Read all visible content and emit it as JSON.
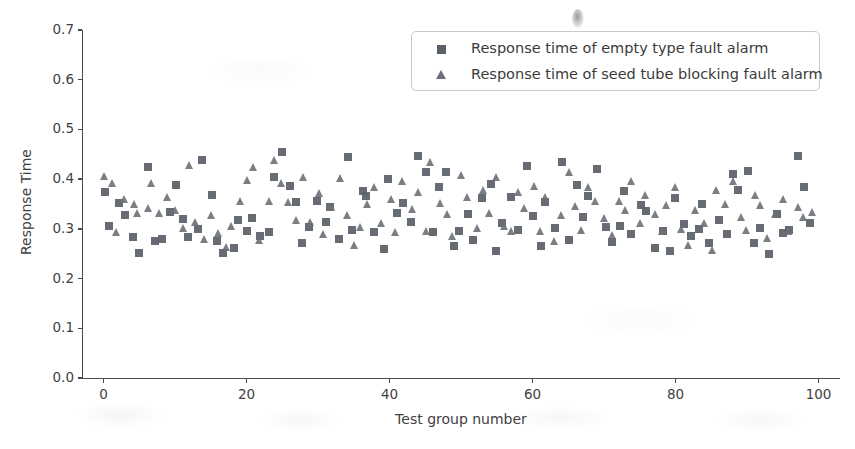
{
  "chart_data": {
    "type": "scatter",
    "title": "",
    "xlabel": "Test group number",
    "ylabel": "Response Time",
    "xlim": [
      -3,
      103
    ],
    "ylim": [
      0.0,
      0.7
    ],
    "xticks": [
      0,
      20,
      40,
      60,
      80,
      100
    ],
    "yticks": [
      "0.0",
      "0.1",
      "0.2",
      "0.3",
      "0.4",
      "0.5",
      "0.6",
      "0.7"
    ],
    "grid": false,
    "legend_position": "upper right",
    "marker_colors": {
      "empty_type": "#5a5f68",
      "seed_tube_blocking": "#6b7078"
    },
    "series": [
      {
        "name": "Response time of empty type fault alarm",
        "marker": "square",
        "color": "#5a5f68",
        "x": [
          0,
          1,
          2,
          3,
          4,
          5,
          6,
          7,
          8,
          9,
          10,
          11,
          12,
          13,
          14,
          15,
          16,
          17,
          18,
          19,
          20,
          21,
          22,
          23,
          24,
          25,
          26,
          27,
          28,
          29,
          30,
          31,
          32,
          33,
          34,
          35,
          36,
          37,
          38,
          39,
          40,
          41,
          42,
          43,
          44,
          45,
          46,
          47,
          48,
          49,
          50,
          51,
          52,
          53,
          54,
          55,
          56,
          57,
          58,
          59,
          60,
          61,
          62,
          63,
          64,
          65,
          66,
          67,
          68,
          69,
          70,
          71,
          72,
          73,
          74,
          75,
          76,
          77,
          78,
          79,
          80,
          81,
          82,
          83,
          84,
          85,
          86,
          87,
          88,
          89,
          90,
          91,
          92,
          93,
          94,
          95,
          96,
          97,
          98,
          99
        ],
        "y": [
          0.37,
          0.31,
          0.35,
          0.33,
          0.29,
          0.25,
          0.42,
          0.28,
          0.28,
          0.34,
          0.39,
          0.32,
          0.29,
          0.3,
          0.44,
          0.37,
          0.27,
          0.25,
          0.26,
          0.32,
          0.29,
          0.32,
          0.28,
          0.3,
          0.41,
          0.45,
          0.39,
          0.35,
          0.27,
          0.3,
          0.36,
          0.31,
          0.34,
          0.28,
          0.45,
          0.3,
          0.38,
          0.36,
          0.3,
          0.26,
          0.4,
          0.33,
          0.35,
          0.31,
          0.44,
          0.42,
          0.29,
          0.38,
          0.41,
          0.27,
          0.3,
          0.33,
          0.28,
          0.36,
          0.39,
          0.26,
          0.31,
          0.37,
          0.3,
          0.43,
          0.33,
          0.26,
          0.35,
          0.3,
          0.43,
          0.28,
          0.39,
          0.32,
          0.36,
          0.42,
          0.3,
          0.27,
          0.31,
          0.38,
          0.29,
          0.35,
          0.33,
          0.26,
          0.3,
          0.26,
          0.36,
          0.31,
          0.28,
          0.3,
          0.35,
          0.27,
          0.32,
          0.29,
          0.41,
          0.38,
          0.42,
          0.27,
          0.3,
          0.25,
          0.33,
          0.29,
          0.3,
          0.44,
          0.38,
          0.31
        ]
      },
      {
        "name": "Response time of seed tube blocking fault alarm",
        "marker": "triangle",
        "color": "#6b7078",
        "x": [
          0,
          1,
          2,
          3,
          4,
          5,
          6,
          7,
          8,
          9,
          10,
          11,
          12,
          13,
          14,
          15,
          16,
          17,
          18,
          19,
          20,
          21,
          22,
          23,
          24,
          25,
          26,
          27,
          28,
          29,
          30,
          31,
          32,
          33,
          34,
          35,
          36,
          37,
          38,
          39,
          40,
          41,
          42,
          43,
          44,
          45,
          46,
          47,
          48,
          49,
          50,
          51,
          52,
          53,
          54,
          55,
          56,
          57,
          58,
          59,
          60,
          61,
          62,
          63,
          64,
          65,
          66,
          67,
          68,
          69,
          70,
          71,
          72,
          73,
          74,
          75,
          76,
          77,
          78,
          79,
          80,
          81,
          82,
          83,
          84,
          85,
          86,
          87,
          88,
          89,
          90,
          91,
          92,
          93,
          94,
          95,
          96,
          97,
          98,
          99
        ],
        "y": [
          0.4,
          0.39,
          0.3,
          0.36,
          0.35,
          0.33,
          0.34,
          0.39,
          0.33,
          0.36,
          0.34,
          0.3,
          0.43,
          0.31,
          0.28,
          0.33,
          0.29,
          0.26,
          0.31,
          0.35,
          0.4,
          0.42,
          0.28,
          0.36,
          0.44,
          0.39,
          0.35,
          0.32,
          0.41,
          0.31,
          0.37,
          0.29,
          0.34,
          0.4,
          0.33,
          0.27,
          0.3,
          0.35,
          0.38,
          0.31,
          0.36,
          0.29,
          0.4,
          0.34,
          0.37,
          0.3,
          0.43,
          0.35,
          0.33,
          0.28,
          0.41,
          0.36,
          0.3,
          0.38,
          0.33,
          0.4,
          0.31,
          0.29,
          0.37,
          0.34,
          0.39,
          0.3,
          0.36,
          0.28,
          0.33,
          0.41,
          0.34,
          0.3,
          0.38,
          0.35,
          0.32,
          0.29,
          0.36,
          0.34,
          0.4,
          0.31,
          0.37,
          0.33,
          0.29,
          0.35,
          0.38,
          0.3,
          0.27,
          0.34,
          0.31,
          0.26,
          0.38,
          0.35,
          0.4,
          0.32,
          0.3,
          0.37,
          0.35,
          0.28,
          0.33,
          0.36,
          0.3,
          0.34,
          0.32,
          0.33
        ]
      }
    ]
  },
  "legend": {
    "items": [
      {
        "label": "Response time of empty type fault alarm",
        "marker": "square"
      },
      {
        "label": "Response time of seed tube blocking fault alarm",
        "marker": "triangle"
      }
    ]
  },
  "axes": {
    "ylabel": "Response Time",
    "xlabel": "Test group number"
  }
}
